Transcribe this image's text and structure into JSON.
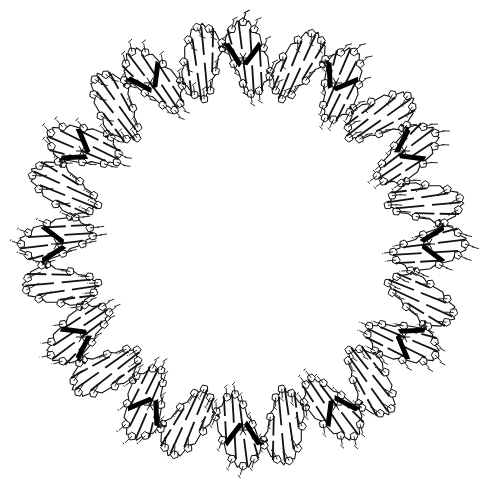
{
  "figure": {
    "width": 486,
    "height": 489,
    "background": "#ffffff",
    "ink_color": "#111111",
    "center": [
      243,
      244
    ],
    "outer_radius": 222,
    "inner_radius": 150,
    "helical_turns": 12,
    "nucleotides_per_turn": 10,
    "groove_color": "#000000"
  }
}
